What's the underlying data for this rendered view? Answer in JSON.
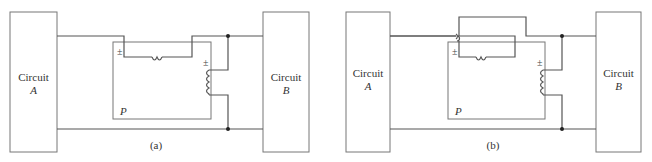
{
  "figure": {
    "panels": [
      {
        "id": "a",
        "caption": "(a)",
        "left_box": {
          "line1": "Circuit",
          "line2": "A"
        },
        "right_box": {
          "line1": "Circuit",
          "line2": "B"
        },
        "meter_label": "P",
        "current_coil_polarity": "±",
        "voltage_coil_polarity": "±"
      },
      {
        "id": "b",
        "caption": "(b)",
        "left_box": {
          "line1": "Circuit",
          "line2": "A"
        },
        "right_box": {
          "line1": "Circuit",
          "line2": "B"
        },
        "meter_label": "P",
        "current_coil_polarity": "±",
        "voltage_coil_polarity": "±"
      }
    ],
    "colors": {
      "wire": "#555555",
      "box": "#777777",
      "text": "#333333"
    }
  }
}
